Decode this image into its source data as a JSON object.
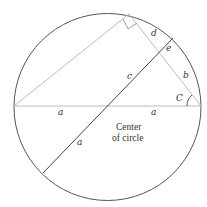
{
  "diagram": {
    "labels": {
      "a_left": "a",
      "a_right": "a",
      "a_lower": "a",
      "b": "b",
      "c": "c",
      "d": "d",
      "e": "e",
      "C": "C"
    },
    "center_note": {
      "line1": "Center",
      "line2": "of circle"
    },
    "colors": {
      "circle": "#555555",
      "triangle": "#bbbbbb",
      "diameter": "#444444"
    }
  }
}
